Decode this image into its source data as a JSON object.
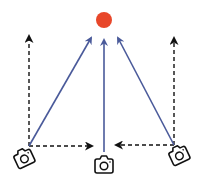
{
  "diagram": {
    "type": "multi-camera-viewpoint",
    "background": "#ffffff",
    "target": {
      "label": "target-point",
      "cx": 104,
      "cy": 20,
      "r": 8,
      "color": "#E8472A"
    },
    "colors": {
      "view_ray": "#4A5A9A",
      "dashed": "#111111",
      "camera": "#111111"
    },
    "cameras": [
      {
        "id": "left",
        "cx": 24,
        "cy": 158,
        "rotation": -25,
        "anchor": [
          29,
          146
        ]
      },
      {
        "id": "center",
        "cx": 104,
        "cy": 165,
        "rotation": 0,
        "anchor": [
          104,
          152
        ]
      },
      {
        "id": "right",
        "cx": 179,
        "cy": 155,
        "rotation": -25,
        "anchor": [
          174,
          145
        ]
      }
    ],
    "view_rays": [
      {
        "from": [
          29,
          146
        ],
        "to": [
          91,
          38
        ]
      },
      {
        "from": [
          104,
          152
        ],
        "to": [
          104,
          40
        ]
      },
      {
        "from": [
          174,
          145
        ],
        "to": [
          118,
          38
        ]
      }
    ],
    "dashed_arrows": [
      {
        "from": [
          29,
          146
        ],
        "to": [
          29,
          36
        ]
      },
      {
        "from": [
          174,
          145
        ],
        "to": [
          174,
          38
        ]
      },
      {
        "from": [
          29,
          146
        ],
        "to": [
          92,
          146
        ]
      },
      {
        "from": [
          174,
          145
        ],
        "to": [
          116,
          145
        ]
      }
    ]
  }
}
